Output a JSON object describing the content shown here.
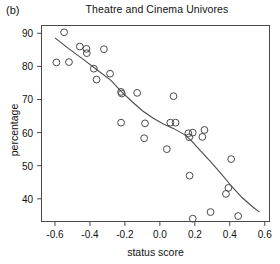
{
  "panel": {
    "label": "(b)"
  },
  "chart_data": {
    "type": "scatter",
    "title": "Theatre and Cinema Univores",
    "xlabel": "status score",
    "ylabel": "percentage",
    "xlim": [
      -0.68,
      0.63
    ],
    "ylim": [
      33.0,
      92.5
    ],
    "xticks": [
      -0.6,
      -0.4,
      -0.2,
      0.0,
      0.2,
      0.4,
      0.6
    ],
    "xticklabels": [
      "-0.6",
      "-0.4",
      "-0.2",
      "0.0",
      "0.2",
      "0.4",
      "0.6"
    ],
    "yticks": [
      40,
      50,
      60,
      70,
      80,
      90
    ],
    "yticklabels": [
      "40",
      "50",
      "60",
      "70",
      "80",
      "90"
    ],
    "grid": false,
    "legend": null,
    "marker": {
      "shape": "circle-open",
      "size": 3.4,
      "color": "#4a4a4a"
    },
    "points": [
      {
        "x": -0.592,
        "y": 81.2
      },
      {
        "x": -0.548,
        "y": 90.3
      },
      {
        "x": -0.52,
        "y": 81.3
      },
      {
        "x": -0.458,
        "y": 86.0
      },
      {
        "x": -0.42,
        "y": 85.3
      },
      {
        "x": -0.418,
        "y": 84.0
      },
      {
        "x": -0.378,
        "y": 79.3
      },
      {
        "x": -0.362,
        "y": 76.0
      },
      {
        "x": -0.32,
        "y": 85.2
      },
      {
        "x": -0.285,
        "y": 77.8
      },
      {
        "x": -0.222,
        "y": 72.3
      },
      {
        "x": -0.218,
        "y": 71.8
      },
      {
        "x": -0.222,
        "y": 63.0
      },
      {
        "x": -0.13,
        "y": 72.0
      },
      {
        "x": -0.085,
        "y": 62.8
      },
      {
        "x": -0.09,
        "y": 58.3
      },
      {
        "x": 0.078,
        "y": 71.0
      },
      {
        "x": 0.06,
        "y": 63.0
      },
      {
        "x": 0.09,
        "y": 63.0
      },
      {
        "x": 0.04,
        "y": 55.0
      },
      {
        "x": 0.163,
        "y": 59.8
      },
      {
        "x": 0.168,
        "y": 58.6
      },
      {
        "x": 0.188,
        "y": 60.0
      },
      {
        "x": 0.255,
        "y": 60.8
      },
      {
        "x": 0.243,
        "y": 58.7
      },
      {
        "x": 0.17,
        "y": 47.0
      },
      {
        "x": 0.188,
        "y": 34.0
      },
      {
        "x": 0.29,
        "y": 36.0
      },
      {
        "x": 0.408,
        "y": 52.0
      },
      {
        "x": 0.392,
        "y": 43.3
      },
      {
        "x": 0.378,
        "y": 41.5
      },
      {
        "x": 0.448,
        "y": 34.8
      }
    ],
    "fit_line": {
      "name": "smoothed trend",
      "color": "#4a4a4a",
      "width": 1.1,
      "points": [
        {
          "x": -0.6,
          "y": 88.6
        },
        {
          "x": -0.52,
          "y": 85.3
        },
        {
          "x": -0.44,
          "y": 82.2
        },
        {
          "x": -0.36,
          "y": 79.0
        },
        {
          "x": -0.28,
          "y": 75.8
        },
        {
          "x": -0.22,
          "y": 72.4
        },
        {
          "x": -0.16,
          "y": 69.4
        },
        {
          "x": -0.1,
          "y": 66.6
        },
        {
          "x": -0.04,
          "y": 64.4
        },
        {
          "x": 0.02,
          "y": 62.6
        },
        {
          "x": 0.08,
          "y": 61.2
        },
        {
          "x": 0.14,
          "y": 59.4
        },
        {
          "x": 0.18,
          "y": 57.6
        },
        {
          "x": 0.23,
          "y": 54.6
        },
        {
          "x": 0.29,
          "y": 51.2
        },
        {
          "x": 0.35,
          "y": 47.6
        },
        {
          "x": 0.41,
          "y": 43.8
        },
        {
          "x": 0.47,
          "y": 40.4
        },
        {
          "x": 0.53,
          "y": 37.6
        },
        {
          "x": 0.57,
          "y": 36.0
        }
      ]
    }
  }
}
